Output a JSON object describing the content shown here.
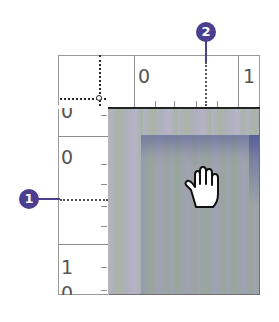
{
  "rulers": {
    "horizontal": {
      "labels": [
        "0",
        "1"
      ]
    },
    "vertical": {
      "labels": [
        "0",
        "0",
        "1",
        "0"
      ]
    }
  },
  "callouts": [
    {
      "number": "1",
      "target": "vertical-ruler-guide"
    },
    {
      "number": "2",
      "target": "horizontal-ruler-guide"
    }
  ],
  "colors": {
    "callout": "#4c3f8f",
    "ruler_text": "#555555"
  },
  "cursor": "hand-icon"
}
